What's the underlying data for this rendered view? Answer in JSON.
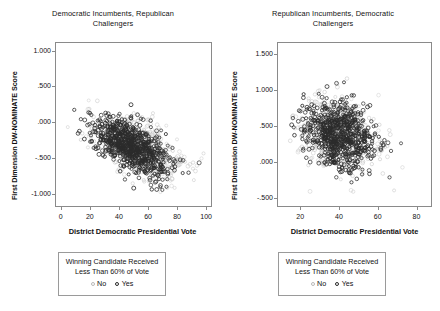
{
  "figure": {
    "background": "#ffffff",
    "axis_color": "#8a8a8a"
  },
  "legend": {
    "title_line1": "Winning Candidate Received",
    "title_line2": "Less Than 60% of Vote",
    "keys": [
      {
        "label": "No",
        "marker": "open-circle",
        "color": "#b9b9b9"
      },
      {
        "label": "Yes",
        "marker": "open-circle",
        "color": "#2b2b2b"
      }
    ]
  },
  "chart_data": [
    {
      "type": "scatter",
      "panel": "left",
      "title": "Democratic Incumbents, Republican Challengers",
      "title_lines": [
        "Democratic Incumbents, Republican",
        "Challengers"
      ],
      "xlabel": "District Democratic Presidential Vote",
      "ylabel": "First Dimension DW-NOMINATE Score",
      "xlim": [
        -4,
        104
      ],
      "ylim": [
        -1.18,
        1.12
      ],
      "xticks": [
        0,
        20,
        40,
        60,
        80,
        100
      ],
      "xtick_labels": [
        "0",
        "20",
        "40",
        "60",
        "80",
        "100"
      ],
      "yticks": [
        -1.0,
        -0.5,
        0.0,
        0.5,
        1.0
      ],
      "ytick_labels": [
        "-1.000",
        "-.500",
        ".000",
        ".500",
        "1.000"
      ],
      "grid": false,
      "legend_position": "below",
      "series": [
        {
          "name": "No",
          "color": "#b9b9b9",
          "marker": "open-circle",
          "n_points": 520,
          "description": "Light gray open circles, winner received 60% or more of vote; negative trend from upper-left to lower-right",
          "cluster": {
            "x_mean": 52,
            "x_sd": 15,
            "y_mean": -0.32,
            "y_sd": 0.22,
            "correlation": -0.52
          }
        },
        {
          "name": "Yes",
          "color": "#2b2b2b",
          "marker": "open-circle",
          "n_points": 760,
          "description": "Dark open circles, winner received less than 60% of vote; dense core between x=30-70, y=-0.60 to 0.00",
          "cluster": {
            "x_mean": 48,
            "x_sd": 13,
            "y_mean": -0.33,
            "y_sd": 0.2,
            "correlation": -0.58
          }
        }
      ]
    },
    {
      "type": "scatter",
      "panel": "right",
      "title": "Republican Incumbents, Democratic Challengers",
      "title_lines": [
        "Republican Incumbents, Democratic",
        "Challengers"
      ],
      "xlabel": "District Democratic Presidential Vote",
      "ylabel": "First Dimension DW-NOMINATE Score",
      "xlim": [
        8,
        88
      ],
      "ylim": [
        -0.62,
        1.66
      ],
      "xticks": [
        20,
        40,
        60,
        80
      ],
      "xtick_labels": [
        "20",
        "40",
        "60",
        "80"
      ],
      "yticks": [
        -0.5,
        0.0,
        0.5,
        1.0,
        1.5
      ],
      "ytick_labels": [
        "-.500",
        ".000",
        ".500",
        "1.000",
        "1.500"
      ],
      "grid": false,
      "legend_position": "below",
      "series": [
        {
          "name": "No",
          "color": "#b9b9b9",
          "marker": "open-circle",
          "n_points": 430,
          "description": "Light gray open circles, winner received 60% or more of vote; broad cloud centered near x=40, y=0.40",
          "cluster": {
            "x_mean": 39,
            "x_sd": 10,
            "y_mean": 0.4,
            "y_sd": 0.27,
            "correlation": -0.18
          }
        },
        {
          "name": "Yes",
          "color": "#2b2b2b",
          "marker": "open-circle",
          "n_points": 700,
          "description": "Dark open circles, winner received less than 60% of vote; dense core between x=30-50, y=0.20 to 0.60",
          "cluster": {
            "x_mean": 40,
            "x_sd": 9,
            "y_mean": 0.38,
            "y_sd": 0.23,
            "correlation": -0.2
          }
        }
      ]
    }
  ]
}
